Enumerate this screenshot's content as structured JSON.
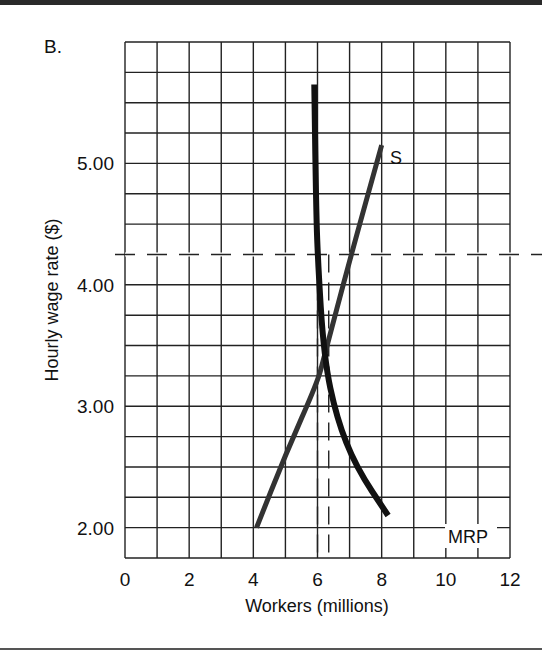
{
  "figure": {
    "panel_label": "B."
  },
  "chart_data": {
    "type": "line",
    "title": "",
    "xlabel": "Workers (millions)",
    "ylabel": "Hourly wage rate ($)",
    "xlim": [
      0,
      12
    ],
    "ylim": [
      1.75,
      6.0
    ],
    "grid": true,
    "grid_x_step": 1,
    "grid_y_step": 0.25,
    "x_ticks": [
      "0",
      "2",
      "4",
      "6",
      "8",
      "10",
      "12"
    ],
    "y_ticks": [
      "2.00",
      "3.00",
      "4.00",
      "5.00"
    ],
    "series": [
      {
        "name": "S",
        "label": "S",
        "description": "Labor supply curve (upward sloping)",
        "points": [
          [
            4.1,
            2.0
          ],
          [
            5.0,
            2.6
          ],
          [
            6.0,
            3.2
          ],
          [
            6.2,
            3.4
          ],
          [
            7.0,
            4.2
          ],
          [
            8.0,
            5.15
          ]
        ]
      },
      {
        "name": "MRP",
        "label": "MRP",
        "description": "Marginal revenue product (labor demand) curve, steep then flattening",
        "points": [
          [
            5.9,
            5.65
          ],
          [
            5.95,
            4.75
          ],
          [
            6.0,
            4.25
          ],
          [
            6.2,
            3.4
          ],
          [
            6.6,
            2.9
          ],
          [
            7.2,
            2.5
          ],
          [
            8.2,
            2.1
          ]
        ]
      }
    ],
    "reference_lines": [
      {
        "orientation": "horizontal",
        "style": "dashed",
        "y": 4.25,
        "note": "extends past plot right edge"
      },
      {
        "orientation": "vertical",
        "style": "dashed",
        "x": 6.0
      },
      {
        "orientation": "vertical",
        "style": "dashed",
        "x": 6.35
      }
    ],
    "equilibrium": {
      "x": 6.2,
      "y": 3.4
    }
  }
}
